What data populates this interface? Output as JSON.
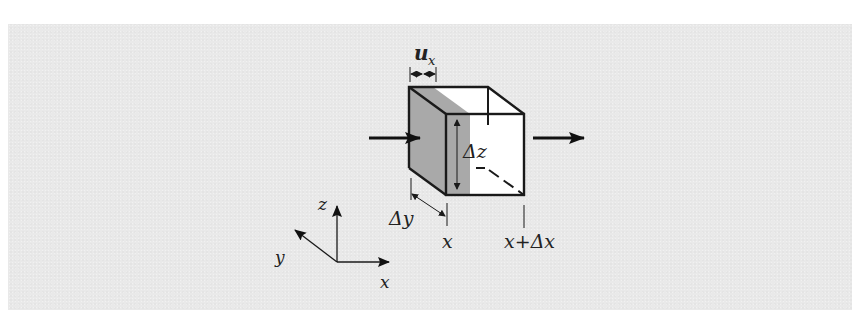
{
  "figure": {
    "type": "control-volume-diagram",
    "colors": {
      "panel_background": "#e9e9e9",
      "shaded_region": "#a9a9a9",
      "cube_face": "#ffffff",
      "stroke": "#1a1a1a"
    }
  },
  "labels": {
    "displacement": "u",
    "displacement_subscript": "x",
    "height": "Δz",
    "depth": "Δy",
    "left_position": "x",
    "right_position": "x+Δx"
  },
  "axes": {
    "z_label": "z",
    "y_label": "y",
    "x_label": "x"
  },
  "arrows": {
    "inflow": "arrow-right",
    "outflow": "arrow-right"
  }
}
